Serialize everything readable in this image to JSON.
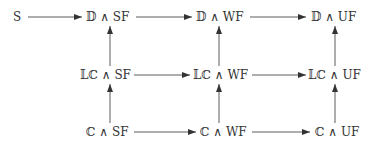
{
  "diagram": {
    "type": "commutative-diagram",
    "nodes": [
      {
        "id": "S",
        "label": "S",
        "row": 0,
        "col": 0
      },
      {
        "id": "D_SF",
        "label": "𝔻 ∧ SF",
        "row": 0,
        "col": 1
      },
      {
        "id": "D_WF",
        "label": "𝔻 ∧ WF",
        "row": 0,
        "col": 2
      },
      {
        "id": "D_UF",
        "label": "𝔻 ∧ UF",
        "row": 0,
        "col": 3
      },
      {
        "id": "LC_SF",
        "label": "𝕃ℂ ∧ SF",
        "row": 1,
        "col": 1
      },
      {
        "id": "LC_WF",
        "label": "𝕃ℂ ∧ WF",
        "row": 1,
        "col": 2
      },
      {
        "id": "LC_UF",
        "label": "𝕃ℂ ∧  UF",
        "row": 1,
        "col": 3
      },
      {
        "id": "C_SF",
        "label": "ℂ ∧ SF",
        "row": 2,
        "col": 1
      },
      {
        "id": "C_WF",
        "label": "ℂ ∧ WF",
        "row": 2,
        "col": 2
      },
      {
        "id": "C_UF",
        "label": "ℂ ∧ UF",
        "row": 2,
        "col": 3
      }
    ],
    "edges": [
      {
        "from": "S",
        "to": "D_SF"
      },
      {
        "from": "D_SF",
        "to": "D_WF"
      },
      {
        "from": "D_WF",
        "to": "D_UF"
      },
      {
        "from": "LC_SF",
        "to": "LC_WF"
      },
      {
        "from": "LC_WF",
        "to": "LC_UF"
      },
      {
        "from": "C_SF",
        "to": "C_WF"
      },
      {
        "from": "C_WF",
        "to": "C_UF"
      },
      {
        "from": "C_SF",
        "to": "LC_SF"
      },
      {
        "from": "LC_SF",
        "to": "D_SF"
      },
      {
        "from": "C_WF",
        "to": "LC_WF"
      },
      {
        "from": "LC_WF",
        "to": "D_WF"
      },
      {
        "from": "C_UF",
        "to": "LC_UF"
      },
      {
        "from": "LC_UF",
        "to": "D_UF"
      }
    ]
  },
  "labels": {
    "S": "S",
    "D_SF": "𝔻 ∧ SF",
    "D_WF": "𝔻 ∧ WF",
    "D_UF": "𝔻 ∧ UF",
    "LC_SF": "𝕃ℂ ∧ SF",
    "LC_WF": "𝕃ℂ ∧ WF",
    "LC_UF": "𝕃ℂ ∧  UF",
    "C_SF": "ℂ ∧ SF",
    "C_WF": "ℂ ∧ WF",
    "C_UF": "ℂ ∧ UF"
  },
  "colors": {
    "stroke": "#333333",
    "text": "#333333",
    "background": "#ffffff"
  }
}
